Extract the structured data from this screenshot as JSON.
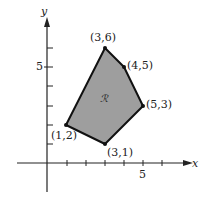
{
  "diagram": {
    "type": "polygon-region-on-axes",
    "axes": {
      "x_label": "x",
      "y_label": "y",
      "x_tick_label": "5",
      "y_tick_label": "5"
    },
    "region_label": "ℛ",
    "vertices": [
      {
        "label": "(3,6)",
        "x": 3,
        "y": 6
      },
      {
        "label": "(4,5)",
        "x": 4,
        "y": 5
      },
      {
        "label": "(5,3)",
        "x": 5,
        "y": 3
      },
      {
        "label": "(3,1)",
        "x": 3,
        "y": 1
      },
      {
        "label": "(1,2)",
        "x": 1,
        "y": 2
      }
    ],
    "colors": {
      "fill": "#9e9e9e",
      "stroke": "#111111",
      "axis": "#222222"
    }
  }
}
